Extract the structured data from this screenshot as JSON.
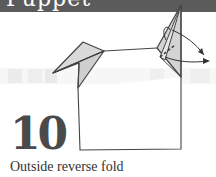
{
  "header": {
    "title_fragment": "Puppet",
    "band_color": "#5b5b5b"
  },
  "step": {
    "number": "10",
    "caption": "Outside reverse fold"
  },
  "diagram": {
    "paper_fill": "#d9d9d9",
    "line_color": "#444444",
    "arrows": [
      "curved-arrow-upper",
      "curved-arrow-lower"
    ],
    "fold_lines": [
      "dashed-valley-line"
    ]
  },
  "colors": {
    "background": "#ffffff",
    "number_color": "#4a4a4a",
    "caption_color": "#333333",
    "background_band": "#efefef"
  }
}
